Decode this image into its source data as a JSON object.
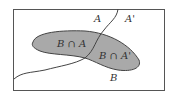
{
  "diagram": {
    "type": "venn-partition",
    "labels": {
      "a": "A",
      "a_complement": "A'",
      "b": "B",
      "b_and_a": "B ∩ A",
      "b_and_a_complement": "B ∩ A'"
    },
    "colors": {
      "background": "#ffffff",
      "border": "#555555",
      "region_b_fill": "#a9a9a9",
      "line": "#444444",
      "text": "#333333"
    }
  }
}
